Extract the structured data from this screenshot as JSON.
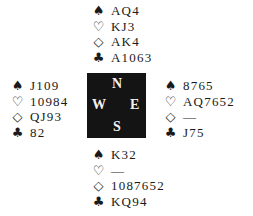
{
  "suit_symbols": {
    "spades": "♠",
    "hearts": "♡",
    "diamonds": "◇",
    "clubs": "♣"
  },
  "hands": {
    "north": {
      "spades": "AQ4",
      "hearts": "KJ3",
      "diamonds": "AK4",
      "clubs": "A1063"
    },
    "west": {
      "spades": "J109",
      "hearts": "10984",
      "diamonds": "QJ93",
      "clubs": "82"
    },
    "east": {
      "spades": "8765",
      "hearts": "AQ7652",
      "diamonds": "—",
      "clubs": "J75"
    },
    "south": {
      "spades": "K32",
      "hearts": "—",
      "diamonds": "1087652",
      "clubs": "KQ94"
    }
  },
  "compass": {
    "n": "N",
    "w": "W",
    "e": "E",
    "s": "S"
  },
  "colors": {
    "compass_bg": "#141414",
    "compass_text": "#f2f2f2",
    "text": "#1a1a1a"
  }
}
